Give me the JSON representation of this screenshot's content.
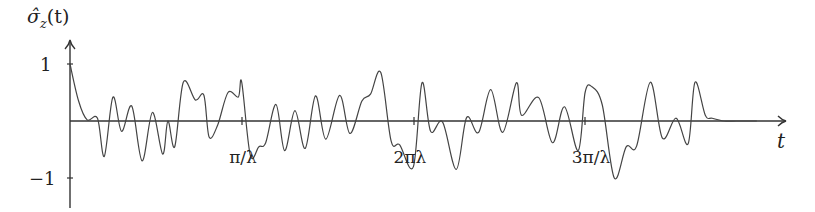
{
  "chart_data": {
    "type": "line",
    "title": "",
    "ylabel": "σ̂_z(t)",
    "xlabel": "t",
    "y_ticks": [
      {
        "value": 1,
        "label": "1"
      },
      {
        "value": -1,
        "label": "−1"
      }
    ],
    "x_ticks": [
      {
        "value": 1,
        "label": "π/λ"
      },
      {
        "value": 2,
        "label": "2πλ"
      },
      {
        "value": 3,
        "label": "3π/λ"
      }
    ],
    "x_unit": "π/λ",
    "xlim": [
      0,
      4.2
    ],
    "ylim": [
      -1.3,
      1.3
    ],
    "grid": false,
    "legend": null,
    "series": [
      {
        "name": "σ̂_z(t)",
        "x": [
          0.0,
          0.05,
          0.1,
          0.16,
          0.2,
          0.25,
          0.3,
          0.36,
          0.42,
          0.48,
          0.54,
          0.57,
          0.61,
          0.66,
          0.73,
          0.78,
          0.81,
          0.86,
          0.92,
          0.98,
          1.0,
          1.05,
          1.1,
          1.14,
          1.2,
          1.25,
          1.31,
          1.37,
          1.43,
          1.49,
          1.57,
          1.63,
          1.7,
          1.75,
          1.81,
          1.87,
          1.92,
          2.0,
          2.05,
          2.1,
          2.17,
          2.25,
          2.31,
          2.38,
          2.45,
          2.52,
          2.6,
          2.63,
          2.73,
          2.81,
          2.88,
          2.96,
          3.0,
          3.04,
          3.1,
          3.17,
          3.24,
          3.3,
          3.38,
          3.45,
          3.53,
          3.6,
          3.64,
          3.7,
          3.74,
          3.81,
          3.88,
          3.95,
          4.0
        ],
        "y": [
          1.0,
          0.35,
          0.02,
          0.05,
          -0.62,
          0.42,
          -0.18,
          0.26,
          -0.7,
          0.15,
          -0.58,
          0.0,
          -0.45,
          0.68,
          0.37,
          0.45,
          -0.28,
          -0.07,
          0.5,
          0.42,
          0.68,
          -0.6,
          -0.45,
          -0.38,
          0.29,
          -0.52,
          0.18,
          -0.48,
          0.44,
          -0.32,
          0.45,
          -0.22,
          0.35,
          0.47,
          0.85,
          -0.35,
          -0.42,
          -0.8,
          0.67,
          -0.18,
          -0.02,
          -0.85,
          0.06,
          -0.2,
          0.55,
          -0.2,
          0.67,
          0.1,
          0.41,
          -0.38,
          0.25,
          -0.52,
          0.5,
          0.6,
          0.28,
          -1.0,
          -0.45,
          -0.44,
          0.68,
          -0.3,
          0.05,
          -0.4,
          0.68,
          0.1,
          0.05,
          0.0,
          0.0,
          0.0,
          0.0
        ]
      }
    ]
  },
  "labels": {
    "y_axis": "σ̂",
    "y_axis_sub": "z",
    "y_axis_arg": "(t)",
    "x_axis": "t",
    "ytick_pos": "1",
    "ytick_neg": "−1",
    "xtick_1": "π/λ",
    "xtick_2": "2πλ",
    "xtick_3": "3π/λ"
  }
}
